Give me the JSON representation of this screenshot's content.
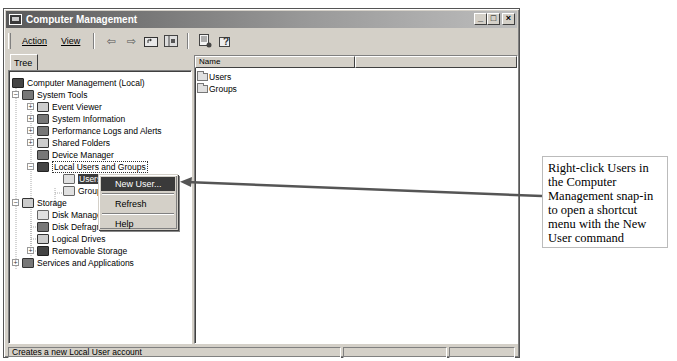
{
  "window": {
    "title": "Computer Management",
    "controls": {
      "minimize": "_",
      "maximize": "□",
      "close": "×"
    }
  },
  "toolbar": {
    "menus": [
      {
        "label": "Action",
        "accel": "A"
      },
      {
        "label": "View",
        "accel": "V"
      }
    ],
    "icons": [
      "back-arrow-icon",
      "forward-arrow-icon",
      "up-folder-icon",
      "show-hide-tree-icon",
      "export-list-icon",
      "help-icon"
    ],
    "back_glyph": "⇦",
    "forward_glyph": "⇨"
  },
  "tree": {
    "tab_label": "Tree",
    "items": [
      {
        "label": "Computer Management (Local)",
        "level": 0,
        "expander": "",
        "icon": "computer-icon"
      },
      {
        "label": "System Tools",
        "level": 1,
        "expander": "−",
        "icon": "tools-icon"
      },
      {
        "label": "Event Viewer",
        "level": 2,
        "expander": "+",
        "icon": "event-viewer-icon"
      },
      {
        "label": "System Information",
        "level": 2,
        "expander": "+",
        "icon": "system-info-icon"
      },
      {
        "label": "Performance Logs and Alerts",
        "level": 2,
        "expander": "+",
        "icon": "performance-icon"
      },
      {
        "label": "Shared Folders",
        "level": 2,
        "expander": "+",
        "icon": "shared-folder-icon"
      },
      {
        "label": "Device Manager",
        "level": 2,
        "expander": "",
        "icon": "device-manager-icon"
      },
      {
        "label": "Local Users and Groups",
        "level": 2,
        "expander": "−",
        "icon": "users-groups-icon"
      },
      {
        "label": "Users",
        "level": 3,
        "expander": "",
        "icon": "folder-icon",
        "selected": true
      },
      {
        "label": "Groups",
        "level": 3,
        "expander": "",
        "icon": "folder-icon"
      },
      {
        "label": "Storage",
        "level": 1,
        "expander": "−",
        "icon": "storage-icon"
      },
      {
        "label": "Disk Management",
        "level": 2,
        "expander": "",
        "icon": "disk-management-icon"
      },
      {
        "label": "Disk Defragmenter",
        "level": 2,
        "expander": "",
        "icon": "defrag-icon"
      },
      {
        "label": "Logical Drives",
        "level": 2,
        "expander": "",
        "icon": "drive-icon"
      },
      {
        "label": "Removable Storage",
        "level": 2,
        "expander": "+",
        "icon": "removable-storage-icon"
      },
      {
        "label": "Services and Applications",
        "level": 1,
        "expander": "+",
        "icon": "services-icon"
      }
    ]
  },
  "list": {
    "columns": [
      "Name",
      ""
    ],
    "rows": [
      {
        "name": "Users"
      },
      {
        "name": "Groups"
      }
    ]
  },
  "context_menu": {
    "items": [
      {
        "label": "New User...",
        "highlighted": true
      },
      {
        "label": "Refresh"
      },
      {
        "label": "Help"
      }
    ]
  },
  "statusbar": {
    "text": "Creates a new Local User account",
    "cells": [
      "",
      ""
    ]
  },
  "annotation": {
    "text": "Right-click Users in the Computer Management snap-in to open a shortcut menu with the New User command",
    "line_color": "#555555"
  }
}
